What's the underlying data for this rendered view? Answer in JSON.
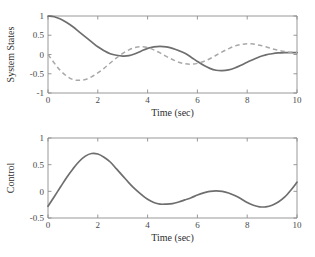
{
  "figure": {
    "background_color": "#ffffff",
    "axis_color": "#8d8d8d",
    "text_color": "#2e2e2e"
  },
  "chart_data": [
    {
      "type": "line",
      "panel": "top",
      "title": "",
      "xlabel": "Time (sec)",
      "ylabel": "System States",
      "xlim": [
        0,
        10
      ],
      "ylim": [
        -1,
        1
      ],
      "xticks": [
        0,
        2,
        4,
        6,
        8,
        10
      ],
      "xticklabels": [
        "0",
        "2",
        "4",
        "6",
        "8",
        "10"
      ],
      "yticks": [
        -1,
        -0.5,
        0,
        0.5,
        1
      ],
      "yticklabels": [
        "-1",
        "-0.5",
        "0",
        "0.5",
        "1"
      ],
      "grid": false,
      "legend": "none",
      "series": [
        {
          "name": "state-x1",
          "style": "solid",
          "color": "#6e6e6e",
          "x": [
            0.0,
            0.25,
            0.5,
            0.75,
            1.0,
            1.25,
            1.5,
            1.75,
            2.0,
            2.25,
            2.5,
            2.75,
            3.0,
            3.25,
            3.5,
            3.75,
            4.0,
            4.25,
            4.5,
            4.75,
            5.0,
            5.25,
            5.5,
            5.75,
            6.0,
            6.25,
            6.5,
            6.75,
            7.0,
            7.25,
            7.5,
            7.75,
            8.0,
            8.25,
            8.5,
            8.75,
            9.0,
            9.25,
            9.5,
            9.75,
            10.0
          ],
          "y": [
            1.0,
            0.98,
            0.92,
            0.83,
            0.72,
            0.59,
            0.46,
            0.33,
            0.2,
            0.1,
            0.02,
            -0.02,
            -0.04,
            -0.03,
            0.02,
            0.09,
            0.16,
            0.2,
            0.21,
            0.2,
            0.16,
            0.1,
            0.03,
            -0.07,
            -0.18,
            -0.28,
            -0.36,
            -0.41,
            -0.42,
            -0.4,
            -0.35,
            -0.28,
            -0.2,
            -0.13,
            -0.06,
            -0.01,
            0.02,
            0.04,
            0.05,
            0.05,
            0.05
          ]
        },
        {
          "name": "state-x2",
          "style": "dashed",
          "color": "#a8a8a8",
          "x": [
            0.0,
            0.25,
            0.5,
            0.75,
            1.0,
            1.25,
            1.5,
            1.75,
            2.0,
            2.25,
            2.5,
            2.75,
            3.0,
            3.25,
            3.5,
            3.75,
            4.0,
            4.25,
            4.5,
            4.75,
            5.0,
            5.25,
            5.5,
            5.75,
            6.0,
            6.25,
            6.5,
            6.75,
            7.0,
            7.25,
            7.5,
            7.75,
            8.0,
            8.25,
            8.5,
            8.75,
            9.0,
            9.25,
            9.5,
            9.75,
            10.0
          ],
          "y": [
            0.0,
            -0.22,
            -0.42,
            -0.56,
            -0.65,
            -0.67,
            -0.65,
            -0.58,
            -0.48,
            -0.36,
            -0.22,
            -0.09,
            0.03,
            0.12,
            0.18,
            0.2,
            0.18,
            0.12,
            0.04,
            -0.05,
            -0.13,
            -0.2,
            -0.24,
            -0.25,
            -0.23,
            -0.18,
            -0.11,
            -0.02,
            0.07,
            0.15,
            0.22,
            0.26,
            0.28,
            0.27,
            0.24,
            0.2,
            0.15,
            0.11,
            0.08,
            0.06,
            0.05
          ]
        }
      ]
    },
    {
      "type": "line",
      "panel": "bottom",
      "title": "",
      "xlabel": "Time (sec)",
      "ylabel": "Control",
      "xlim": [
        0,
        10
      ],
      "ylim": [
        -0.5,
        1
      ],
      "xticks": [
        0,
        2,
        4,
        6,
        8,
        10
      ],
      "xticklabels": [
        "0",
        "2",
        "4",
        "6",
        "8",
        "10"
      ],
      "yticks": [
        -0.5,
        0,
        0.5,
        1
      ],
      "yticklabels": [
        "-0.5",
        "0",
        "0.5",
        "1"
      ],
      "grid": false,
      "legend": "none",
      "series": [
        {
          "name": "control-u",
          "style": "solid",
          "color": "#6e6e6e",
          "x": [
            0.0,
            0.25,
            0.5,
            0.75,
            1.0,
            1.25,
            1.5,
            1.75,
            2.0,
            2.25,
            2.5,
            2.75,
            3.0,
            3.25,
            3.5,
            3.75,
            4.0,
            4.25,
            4.5,
            4.75,
            5.0,
            5.25,
            5.5,
            5.75,
            6.0,
            6.25,
            6.5,
            6.75,
            7.0,
            7.25,
            7.5,
            7.75,
            8.0,
            8.25,
            8.5,
            8.75,
            9.0,
            9.25,
            9.5,
            9.75,
            10.0
          ],
          "y": [
            -0.28,
            -0.1,
            0.08,
            0.26,
            0.42,
            0.56,
            0.66,
            0.71,
            0.7,
            0.64,
            0.55,
            0.42,
            0.29,
            0.16,
            0.04,
            -0.06,
            -0.15,
            -0.21,
            -0.24,
            -0.24,
            -0.23,
            -0.2,
            -0.16,
            -0.12,
            -0.07,
            -0.03,
            0.0,
            0.01,
            0.0,
            -0.03,
            -0.08,
            -0.14,
            -0.21,
            -0.26,
            -0.29,
            -0.29,
            -0.26,
            -0.2,
            -0.11,
            0.02,
            0.17
          ]
        }
      ]
    }
  ]
}
